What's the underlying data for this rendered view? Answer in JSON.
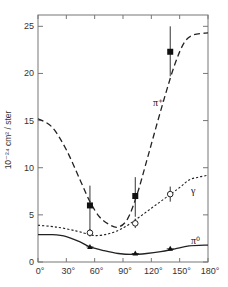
{
  "chart_data": {
    "type": "line",
    "title": "",
    "xlabel": "",
    "ylabel": "10⁻²⁴ cm² / ster",
    "xlim": [
      0,
      180
    ],
    "ylim": [
      0,
      26.2
    ],
    "x_ticks": [
      "0°",
      "30°",
      "60°",
      "90°",
      "120°",
      "150°",
      "180°"
    ],
    "x_tick_values": [
      0,
      30,
      60,
      90,
      120,
      150,
      180
    ],
    "y_ticks": [
      "0",
      "5",
      "10",
      "15",
      "20",
      "25"
    ],
    "y_tick_values": [
      0,
      5,
      10,
      15,
      20,
      25
    ],
    "grid": false,
    "legend": "inline labels near curves",
    "series": [
      {
        "name": "π⁺",
        "label": "π⁺",
        "style": "long-dashed curve with filled squares",
        "curve": {
          "x": [
            0,
            15,
            30,
            45,
            55,
            65,
            75,
            85,
            95,
            105,
            115,
            125,
            135,
            145,
            155,
            165,
            180
          ],
          "y": [
            15.2,
            14.3,
            11.9,
            8.6,
            6.4,
            4.8,
            4.0,
            3.7,
            4.6,
            7.2,
            10.7,
            14.3,
            17.8,
            21.0,
            23.3,
            24.1,
            24.3
          ]
        },
        "points": [
          {
            "x": 55,
            "y": 6.0,
            "err_low": 3.3,
            "err_high": 8.1
          },
          {
            "x": 103,
            "y": 7.0,
            "err_low": 4.8,
            "err_high": 9.0
          },
          {
            "x": 140,
            "y": 22.3,
            "err_low": 19.7,
            "err_high": 25.0
          }
        ]
      },
      {
        "name": "γ",
        "label": "γ",
        "style": "short-dashed (dotted) curve with open circles",
        "curve": {
          "x": [
            0,
            20,
            40,
            55,
            62,
            75,
            90,
            105,
            120,
            135,
            150,
            160,
            170,
            180
          ],
          "y": [
            3.9,
            3.7,
            3.3,
            2.9,
            2.8,
            3.0,
            3.6,
            4.6,
            5.7,
            6.8,
            7.9,
            8.7,
            9.0,
            9.2
          ]
        },
        "points": [
          {
            "x": 55,
            "y": 3.1,
            "err_low": 2.7,
            "err_high": 3.5
          },
          {
            "x": 103,
            "y": 4.1,
            "err_low": 3.6,
            "err_high": 4.6
          },
          {
            "x": 140,
            "y": 7.2,
            "err_low": 6.4,
            "err_high": 8.0
          }
        ]
      },
      {
        "name": "π⁰",
        "label": "π⁰",
        "style": "solid curve with filled triangles",
        "curve": {
          "x": [
            0,
            15,
            30,
            45,
            55,
            70,
            85,
            100,
            115,
            130,
            145,
            160,
            180
          ],
          "y": [
            2.9,
            2.9,
            2.7,
            2.1,
            1.6,
            1.2,
            0.9,
            0.8,
            0.9,
            1.1,
            1.4,
            1.7,
            1.8
          ]
        },
        "points": [
          {
            "x": 55,
            "y": 1.6
          },
          {
            "x": 103,
            "y": 0.9
          },
          {
            "x": 140,
            "y": 1.4
          }
        ]
      }
    ]
  }
}
